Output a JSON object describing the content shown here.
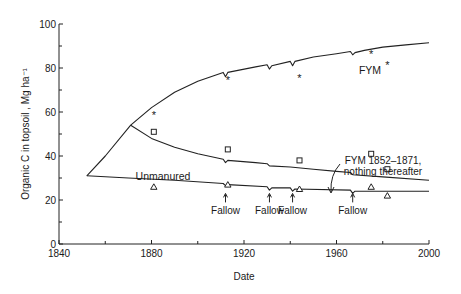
{
  "chart_data": {
    "type": "line",
    "title": "",
    "xlabel": "Date",
    "ylabel": "Organic C in topsoil , Mg ha⁻¹",
    "xlim": [
      1840,
      2000
    ],
    "ylim": [
      0,
      100
    ],
    "x_ticks": [
      1840,
      1880,
      1920,
      1960,
      2000
    ],
    "x_minor_ticks": [
      1860,
      1900,
      1940,
      1980
    ],
    "y_ticks": [
      0,
      20,
      40,
      60,
      80,
      100
    ],
    "y_minor_ticks": [
      10,
      30,
      50,
      70,
      90
    ],
    "grid": false,
    "legend": "inline labels",
    "series": [
      {
        "name": "FYM",
        "label": "FYM",
        "kind": "modelled line",
        "points": [
          [
            1852,
            31
          ],
          [
            1860,
            40
          ],
          [
            1871,
            54
          ],
          [
            1880,
            62
          ],
          [
            1890,
            69
          ],
          [
            1900,
            74
          ],
          [
            1911,
            78
          ],
          [
            1912,
            76
          ],
          [
            1913,
            78
          ],
          [
            1925,
            80.5
          ],
          [
            1930,
            81.5
          ],
          [
            1931,
            79.5
          ],
          [
            1932,
            81
          ],
          [
            1940,
            83
          ],
          [
            1941,
            81
          ],
          [
            1942,
            83
          ],
          [
            1950,
            85
          ],
          [
            1960,
            86.5
          ],
          [
            1966,
            87.5
          ],
          [
            1967,
            86
          ],
          [
            1968,
            87
          ],
          [
            1972,
            88
          ],
          [
            1980,
            89.5
          ],
          [
            1990,
            90.5
          ],
          [
            2000,
            91.5
          ]
        ]
      },
      {
        "name": "FYM 1852-1871, nothing thereafter",
        "label": "FYM 1852–1871,\nnothing thereafter",
        "kind": "modelled line",
        "points": [
          [
            1871,
            54
          ],
          [
            1880,
            48
          ],
          [
            1890,
            44
          ],
          [
            1900,
            41
          ],
          [
            1911,
            38.5
          ],
          [
            1912,
            37
          ],
          [
            1913,
            38
          ],
          [
            1925,
            37
          ],
          [
            1930,
            36.5
          ],
          [
            1931,
            35.5
          ],
          [
            1940,
            35
          ],
          [
            1950,
            34
          ],
          [
            1960,
            33
          ],
          [
            1966,
            32.5
          ],
          [
            1967,
            31.5
          ],
          [
            1980,
            30.5
          ],
          [
            2000,
            29
          ]
        ]
      },
      {
        "name": "Unmanured",
        "label": "Unmanured",
        "kind": "modelled line",
        "points": [
          [
            1852,
            31
          ],
          [
            1870,
            30
          ],
          [
            1890,
            29
          ],
          [
            1911,
            27.5
          ],
          [
            1912,
            26.5
          ],
          [
            1913,
            27
          ],
          [
            1930,
            26
          ],
          [
            1931,
            24.5
          ],
          [
            1932,
            25.5
          ],
          [
            1940,
            25.5
          ],
          [
            1941,
            24
          ],
          [
            1942,
            25
          ],
          [
            1966,
            24.5
          ],
          [
            1967,
            23
          ],
          [
            1968,
            24
          ],
          [
            2000,
            24
          ]
        ]
      }
    ],
    "observations": [
      {
        "series": "FYM",
        "marker": "asterisk",
        "points": [
          [
            1881,
            59
          ],
          [
            1913,
            75
          ],
          [
            1944,
            76
          ],
          [
            1975,
            87
          ],
          [
            1982,
            82
          ]
        ]
      },
      {
        "series": "FYM 1852-1871, nothing thereafter",
        "marker": "square",
        "points": [
          [
            1881,
            51
          ],
          [
            1913,
            43
          ],
          [
            1944,
            38
          ],
          [
            1975,
            41
          ],
          [
            1982,
            34
          ]
        ]
      },
      {
        "series": "Unmanured",
        "marker": "triangle",
        "points": [
          [
            1881,
            26
          ],
          [
            1913,
            27
          ],
          [
            1944,
            25
          ],
          [
            1975,
            26
          ],
          [
            1982,
            22
          ]
        ]
      }
    ],
    "annotations": [
      {
        "text": "Fallow",
        "x": 1912
      },
      {
        "text": "Fallow",
        "x": 1931
      },
      {
        "text": "Fallow",
        "x": 1941
      },
      {
        "text": "Fallow",
        "x": 1967
      }
    ]
  },
  "labels": {
    "fym": "FYM",
    "fym_stop_line1": "FYM 1852–1871,",
    "fym_stop_line2": "nothing thereafter",
    "unmanured": "Unmanured",
    "fallow": "Fallow",
    "xlabel": "Date",
    "ylabel": "Organic C in topsoil , Mg ha⁻¹"
  }
}
